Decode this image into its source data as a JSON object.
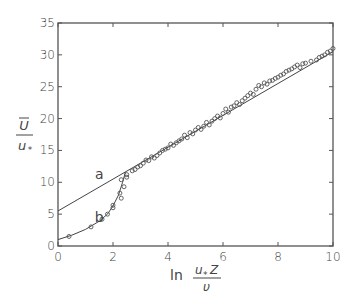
{
  "chart_data": {
    "type": "scatter",
    "title": "",
    "xlabel": "ln (u* z / ν)",
    "ylabel": "Ū / u*",
    "xlabel_parts": {
      "prefix": "ln",
      "numerator": "u",
      "numerator_sub": "*",
      "numerator_var": "Z",
      "denominator": "υ"
    },
    "ylabel_parts": {
      "numerator": "U",
      "denominator": "u",
      "denominator_sub": "*"
    },
    "xlim": [
      0,
      10
    ],
    "ylim": [
      0,
      35
    ],
    "xticks": [
      "0",
      "2",
      "4",
      "6",
      "8",
      "10"
    ],
    "yticks": [
      "0",
      "5",
      "10",
      "15",
      "20",
      "25",
      "30",
      "35"
    ],
    "grid": false,
    "legend": null,
    "annotations": [
      {
        "text": "a",
        "x": 1.5,
        "y": 10.5
      },
      {
        "text": "b",
        "x": 1.5,
        "y": 3.8
      }
    ],
    "series": [
      {
        "name": "a",
        "kind": "line",
        "description": "log-law line",
        "x": [
          0,
          10
        ],
        "y": [
          5.5,
          30.5
        ]
      },
      {
        "name": "b",
        "kind": "curve",
        "description": "viscous sublayer / buffer curve",
        "x": [
          0,
          0.5,
          1.0,
          1.5,
          1.8,
          2.0,
          2.2,
          2.35,
          2.45
        ],
        "y": [
          1.0,
          1.7,
          2.6,
          3.9,
          5.0,
          6.3,
          8.0,
          10.0,
          11.6
        ]
      },
      {
        "name": "measurements",
        "kind": "points",
        "x": [
          0.4,
          1.2,
          1.6,
          1.8,
          2.0,
          2.0,
          2.25,
          2.3,
          2.4,
          2.3,
          2.5,
          2.5,
          2.7,
          2.8,
          2.9,
          3.0,
          3.1,
          3.2,
          3.3,
          3.4,
          3.5,
          3.6,
          3.7,
          3.8,
          3.9,
          4.0,
          4.1,
          4.2,
          4.3,
          4.4,
          4.5,
          4.6,
          4.7,
          4.8,
          4.9,
          5.0,
          5.1,
          5.2,
          5.3,
          5.4,
          5.5,
          5.6,
          5.7,
          5.8,
          5.9,
          6.0,
          6.1,
          6.2,
          6.3,
          6.4,
          6.5,
          6.6,
          6.7,
          6.8,
          6.9,
          7.0,
          7.1,
          7.2,
          7.3,
          7.4,
          7.5,
          7.6,
          7.7,
          7.8,
          7.9,
          8.0,
          8.1,
          8.2,
          8.3,
          8.4,
          8.5,
          8.6,
          8.7,
          8.8,
          8.9,
          9.0,
          9.2,
          9.4,
          9.5,
          9.6,
          9.7,
          9.8,
          9.9,
          10.0
        ],
        "y": [
          1.5,
          3.0,
          4.2,
          5.0,
          6.4,
          6.0,
          8.3,
          7.5,
          9.3,
          10.4,
          10.8,
          11.2,
          11.8,
          12.0,
          12.4,
          12.6,
          13.0,
          13.5,
          13.4,
          14.0,
          13.8,
          14.2,
          14.6,
          15.0,
          15.2,
          15.4,
          16.0,
          15.8,
          16.2,
          16.5,
          16.8,
          17.4,
          17.0,
          17.8,
          17.6,
          18.2,
          18.6,
          18.3,
          18.8,
          19.4,
          19.0,
          19.6,
          20.0,
          20.4,
          20.1,
          20.8,
          21.5,
          21.0,
          21.8,
          22.0,
          22.5,
          22.2,
          22.8,
          23.2,
          23.6,
          24.0,
          23.8,
          24.6,
          25.2,
          25.0,
          25.6,
          25.4,
          25.9,
          26.0,
          26.3,
          26.5,
          26.8,
          27.0,
          27.4,
          27.6,
          27.8,
          28.1,
          28.4,
          28.0,
          28.6,
          28.7,
          29.0,
          29.2,
          29.6,
          29.8,
          30.0,
          30.4,
          30.6,
          31.0
        ]
      }
    ]
  },
  "colors": {
    "axis": "#555555",
    "line": "#444444",
    "marker": "#555555",
    "text": "#444444"
  }
}
